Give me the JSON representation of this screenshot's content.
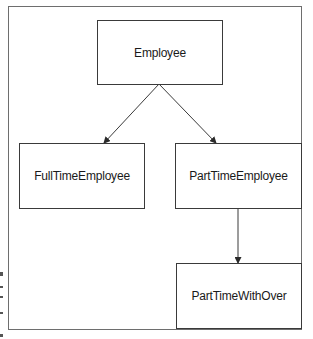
{
  "diagram": {
    "type": "class-inheritance-hierarchy",
    "nodes": [
      {
        "id": "employee",
        "label": "Employee"
      },
      {
        "id": "full_time",
        "label": "FullTimeEmployee"
      },
      {
        "id": "part_time",
        "label": "PartTimeEmployee"
      },
      {
        "id": "part_time_over",
        "label": "PartTimeWithOver"
      }
    ],
    "edges": [
      {
        "from": "employee",
        "to": "full_time",
        "style": "arrow"
      },
      {
        "from": "employee",
        "to": "part_time",
        "style": "arrow"
      },
      {
        "from": "part_time",
        "to": "part_time_over",
        "style": "arrow"
      }
    ]
  },
  "colors": {
    "border": "#3a3a3a",
    "frame": "#6e6e6e",
    "text": "#1a1a1a",
    "background": "#ffffff"
  }
}
